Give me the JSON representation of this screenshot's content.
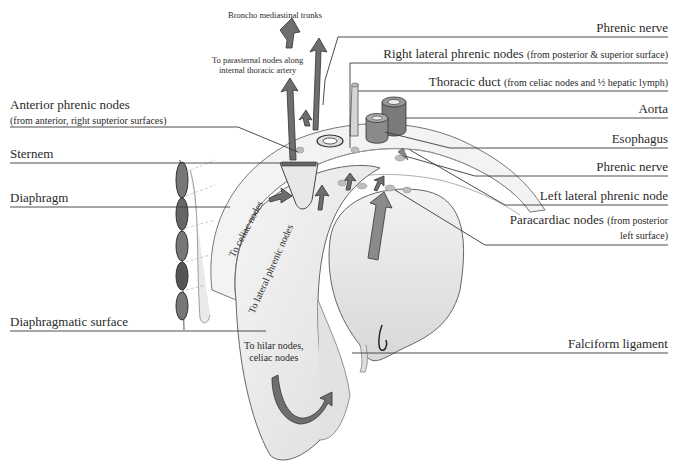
{
  "figure": {
    "left_labels": [
      {
        "id": "anterior-phrenic-nodes",
        "text": "Anterior phrenic nodes",
        "sub": "(from anterior, right supterior surfaces)"
      },
      {
        "id": "sternem",
        "text": "Sternem"
      },
      {
        "id": "diaphragm",
        "text": "Diaphragm"
      },
      {
        "id": "diaphragmatic-surface",
        "text": "Diaphragmatic surface"
      }
    ],
    "right_labels": [
      {
        "id": "phrenic-nerve-top",
        "text": "Phrenic nerve",
        "sub": ""
      },
      {
        "id": "right-lateral-phrenic-nodes",
        "text": "Right lateral phrenic nodes",
        "sub": "(from posterior & superior surface)"
      },
      {
        "id": "thoracic-duct",
        "text": "Thoracic duct",
        "sub": "(from celiac nodes and ½ hepatic lymph)"
      },
      {
        "id": "aorta",
        "text": "Aorta",
        "sub": ""
      },
      {
        "id": "esophagus",
        "text": "Esophagus",
        "sub": ""
      },
      {
        "id": "phrenic-nerve-bottom",
        "text": "Phrenic nerve",
        "sub": ""
      },
      {
        "id": "left-lateral-phrenic-node",
        "text": "Left lateral phrenic node",
        "sub": ""
      },
      {
        "id": "paracardiac-nodes",
        "text": "Paracardiac  nodes",
        "sub": "(from posterior",
        "sub2": "left surface)"
      },
      {
        "id": "falciform-ligament",
        "text": "Falciform ligament",
        "sub": ""
      }
    ],
    "annotations": {
      "broncho": "Broncho mediastinal trunks",
      "parasternal_1": "To parasternal nodes along",
      "parasternal_2": "internal thoracic artery",
      "to_celiac": "To celiac nodes",
      "to_lateral_phrenic": "To lateral phrenic nodes",
      "hilar_1": "To hilar nodes,",
      "hilar_2": "celiac nodes"
    },
    "colors": {
      "ink": "#2a2a2a",
      "leader": "#3a3a3a",
      "liver_fill": "#ececec",
      "arrow_fill": "#6e6e6e",
      "diaphragm_fill": "#f3f3f3"
    }
  }
}
